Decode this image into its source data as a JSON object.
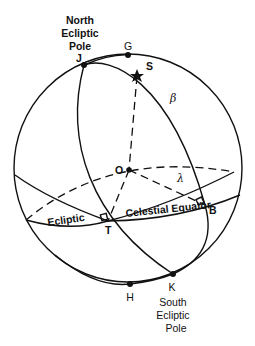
{
  "diagram": {
    "labels": {
      "north_pole": [
        "North",
        "Ecliptic",
        "Pole"
      ],
      "south_pole": [
        "South",
        "Ecliptic",
        "Pole"
      ],
      "J": "J",
      "G": "G",
      "S": "S",
      "beta": "β",
      "O": "O",
      "B": "B",
      "lambda": "λ",
      "T": "T",
      "ecliptic": "Ecliptic",
      "celestial_equator": "Celestial Equator",
      "H": "H",
      "K": "K"
    },
    "points": {
      "J": [
        84,
        65
      ],
      "G": [
        128,
        55
      ],
      "S": [
        137,
        76
      ],
      "O": [
        129,
        170
      ],
      "B": [
        205,
        205
      ],
      "T": [
        108,
        221
      ],
      "H": [
        130,
        284
      ],
      "K": [
        173,
        274
      ]
    },
    "sphere": {
      "cx": 128,
      "cy": 168,
      "r": 114
    },
    "colors": {
      "ink": "#111111",
      "background": "#ffffff"
    }
  }
}
